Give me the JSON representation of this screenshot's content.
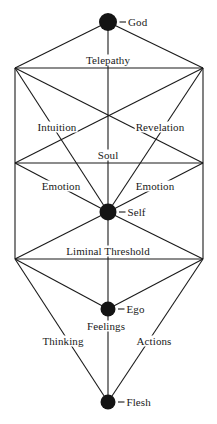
{
  "diagram": {
    "type": "node-link-diagram",
    "colors": {
      "node_fill": "#141414",
      "line": "#1a1a1a",
      "text": "#1a1a1a",
      "background": "#ffffff"
    },
    "nodes": [
      {
        "id": "god",
        "label": "God",
        "x": 108,
        "y": 22,
        "r": 9,
        "label_dx": 13,
        "label_dy": 0
      },
      {
        "id": "self",
        "label": "Self",
        "x": 108,
        "y": 212,
        "r": 8.5,
        "label_dx": 13,
        "label_dy": 0
      },
      {
        "id": "ego",
        "label": "Ego",
        "x": 108,
        "y": 309,
        "r": 7.5,
        "label_dx": 13,
        "label_dy": 0
      },
      {
        "id": "flesh",
        "label": "Flesh",
        "x": 108,
        "y": 402,
        "r": 7.5,
        "label_dx": 13,
        "label_dy": 0
      }
    ],
    "edge_labels": [
      {
        "id": "telepathy",
        "label": "Telepathy",
        "x": 108,
        "y": 60
      },
      {
        "id": "intuition",
        "label": "Intuition",
        "x": 57,
        "y": 127
      },
      {
        "id": "revelation",
        "label": "Revelation",
        "x": 160,
        "y": 127
      },
      {
        "id": "soul",
        "label": "Soul",
        "x": 108,
        "y": 155
      },
      {
        "id": "emotion-left",
        "label": "Emotion",
        "x": 61,
        "y": 186
      },
      {
        "id": "emotion-right",
        "label": "Emotion",
        "x": 155,
        "y": 186
      },
      {
        "id": "liminal-threshold",
        "label": "Liminal Threshold",
        "x": 108,
        "y": 251
      },
      {
        "id": "feelings",
        "label": "Feelings",
        "x": 106,
        "y": 326
      },
      {
        "id": "thinking",
        "label": "Thinking",
        "x": 63,
        "y": 341
      },
      {
        "id": "actions",
        "label": "Actions",
        "x": 154,
        "y": 341
      }
    ],
    "vertices": {
      "top_left": {
        "x": 15,
        "y": 68
      },
      "top_right": {
        "x": 203,
        "y": 68
      },
      "soul_left": {
        "x": 15,
        "y": 163
      },
      "soul_right": {
        "x": 203,
        "y": 163
      },
      "liminal_left": {
        "x": 15,
        "y": 259
      },
      "liminal_right": {
        "x": 203,
        "y": 259
      }
    },
    "edges": [
      {
        "from": "god",
        "to": "top_left",
        "name": "god-to-top-left"
      },
      {
        "from": "god",
        "to": "top_right",
        "name": "god-to-top-right"
      },
      {
        "from": "god",
        "to": "self",
        "name": "god-to-self-axis"
      },
      {
        "from": "top_left",
        "to": "top_right",
        "name": "telepathy-line"
      },
      {
        "from": "top_left",
        "to": "liminal_left",
        "name": "left-vertical-edge"
      },
      {
        "from": "top_right",
        "to": "liminal_right",
        "name": "right-vertical-edge"
      },
      {
        "from": "soul_left",
        "to": "soul_right",
        "name": "soul-line"
      },
      {
        "from": "top_left",
        "to": "soul_right",
        "name": "top-left-to-soul-right"
      },
      {
        "from": "top_right",
        "to": "soul_left",
        "name": "top-right-to-soul-left"
      },
      {
        "from": "top_left",
        "to": "self",
        "name": "intuition-line"
      },
      {
        "from": "top_right",
        "to": "self",
        "name": "revelation-line"
      },
      {
        "from": "soul_left",
        "to": "self",
        "name": "emotion-left-line"
      },
      {
        "from": "soul_right",
        "to": "self",
        "name": "emotion-right-line"
      },
      {
        "from": "self",
        "to": "liminal_left",
        "name": "self-to-liminal-left"
      },
      {
        "from": "self",
        "to": "liminal_right",
        "name": "self-to-liminal-right"
      },
      {
        "from": "liminal_left",
        "to": "liminal_right",
        "name": "liminal-threshold-line"
      },
      {
        "from": "liminal_left",
        "to": "ego",
        "name": "liminal-left-to-ego"
      },
      {
        "from": "liminal_right",
        "to": "ego",
        "name": "liminal-right-to-ego"
      },
      {
        "from": "liminal_left",
        "to": "flesh",
        "name": "thinking-line"
      },
      {
        "from": "liminal_right",
        "to": "flesh",
        "name": "actions-line"
      },
      {
        "from": "self",
        "to": "flesh",
        "name": "self-to-flesh-axis"
      }
    ]
  }
}
